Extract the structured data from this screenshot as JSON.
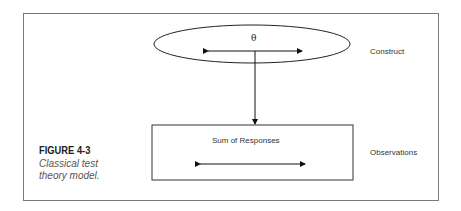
{
  "figure": {
    "number": "FIGURE 4-3",
    "caption_line1": "Classical test",
    "caption_line2": "theory model."
  },
  "diagram": {
    "construct_node": {
      "symbol": "θ",
      "side_label": "Construct"
    },
    "observation_node": {
      "label": "Sum of Responses",
      "side_label": "Observations"
    },
    "edges": [
      {
        "from": "construct_node",
        "to": "observation_node",
        "type": "directed-down"
      }
    ]
  }
}
